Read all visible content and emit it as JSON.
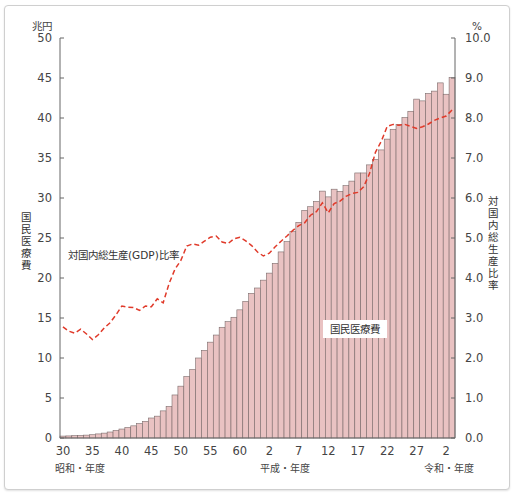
{
  "chart_data": {
    "type": "bar+line",
    "title": "",
    "left_unit": "兆円",
    "right_unit": "%",
    "left_axis_label": "国民医療費",
    "right_axis_label": "対国内総生産比率",
    "left_ticks": [
      "0",
      "5",
      "10",
      "15",
      "20",
      "25",
      "30",
      "35",
      "40",
      "45",
      "50"
    ],
    "right_ticks": [
      "0.0",
      "1.0",
      "2.0",
      "3.0",
      "4.0",
      "5.0",
      "6.0",
      "7.0",
      "8.0",
      "9.0",
      "10.0"
    ],
    "ylim_left": [
      0,
      50
    ],
    "ylim_right": [
      0,
      10
    ],
    "x_tick_labels": [
      {
        "label": "30",
        "index": 0
      },
      {
        "label": "35",
        "index": 5
      },
      {
        "label": "40",
        "index": 10
      },
      {
        "label": "45",
        "index": 15
      },
      {
        "label": "50",
        "index": 20
      },
      {
        "label": "55",
        "index": 25
      },
      {
        "label": "60",
        "index": 30
      },
      {
        "label": "2",
        "index": 35
      },
      {
        "label": "7",
        "index": 40
      },
      {
        "label": "12",
        "index": 45
      },
      {
        "label": "17",
        "index": 50
      },
      {
        "label": "22",
        "index": 55
      },
      {
        "label": "27",
        "index": 60
      },
      {
        "label": "2",
        "index": 65
      }
    ],
    "era_labels": [
      {
        "label": "昭和・年度",
        "index": 0
      },
      {
        "label": "平成・年度",
        "index": 35
      },
      {
        "label": "令和・年度",
        "index": 65
      }
    ],
    "grid": false,
    "series": [
      {
        "name": "国民医療費",
        "type": "bar",
        "axis": "left",
        "unit": "兆円",
        "color": "#e9c2c2",
        "edge": "#7a6a6a",
        "values": [
          0.24,
          0.26,
          0.29,
          0.32,
          0.36,
          0.41,
          0.51,
          0.61,
          0.75,
          0.94,
          1.12,
          1.31,
          1.52,
          1.8,
          2.08,
          2.5,
          2.73,
          3.39,
          3.94,
          5.38,
          6.48,
          7.68,
          8.56,
          10.0,
          10.95,
          11.98,
          12.87,
          13.84,
          14.54,
          15.09,
          16.02,
          17.07,
          18.08,
          18.75,
          19.73,
          20.61,
          21.83,
          23.26,
          24.54,
          25.79,
          26.96,
          28.45,
          28.91,
          29.58,
          30.86,
          30.14,
          31.1,
          30.83,
          31.54,
          32.11,
          33.13,
          33.13,
          34.14,
          34.81,
          36.01,
          37.36,
          38.59,
          39.21,
          40.06,
          40.84,
          42.36,
          42.14,
          43.07,
          43.36,
          44.39,
          42.97,
          45.04
        ],
        "x_start": "昭和30",
        "x_end": "令和3"
      },
      {
        "name": "対国内総生産(GDP)比率",
        "type": "line",
        "style": "dashed",
        "axis": "right",
        "unit": "%",
        "color": "#e03a2a",
        "values": [
          2.78,
          2.67,
          2.62,
          2.72,
          2.6,
          2.46,
          2.58,
          2.75,
          2.88,
          3.08,
          3.3,
          3.27,
          3.26,
          3.19,
          3.3,
          3.28,
          3.48,
          3.38,
          3.86,
          4.22,
          4.44,
          4.8,
          4.85,
          4.82,
          4.92,
          5.02,
          5.05,
          4.9,
          4.86,
          4.98,
          5.02,
          4.93,
          4.81,
          4.65,
          4.55,
          4.62,
          4.78,
          4.92,
          5.05,
          5.19,
          5.31,
          5.38,
          5.57,
          5.66,
          5.88,
          5.63,
          5.86,
          5.92,
          6.04,
          6.11,
          6.14,
          6.28,
          6.61,
          7.14,
          7.42,
          7.79,
          7.84,
          7.82,
          7.84,
          7.79,
          7.74,
          7.78,
          7.85,
          7.94,
          8.0,
          8.05,
          8.2
        ]
      }
    ],
    "annotations": [
      {
        "text": "対国内総生産(GDP)比率",
        "near": "line"
      },
      {
        "text": "国民医療費",
        "near": "bars"
      }
    ]
  },
  "labels": {
    "left_unit": "兆円",
    "right_unit": "%",
    "left_axis_title": "国民医療費",
    "right_axis_title": "対国内総生産比率",
    "line_annotation": "対国内総生産(GDP)比率",
    "bar_annotation": "国民医療費",
    "era_showa": "昭和・年度",
    "era_heisei": "平成・年度",
    "era_reiwa": "令和・年度"
  }
}
